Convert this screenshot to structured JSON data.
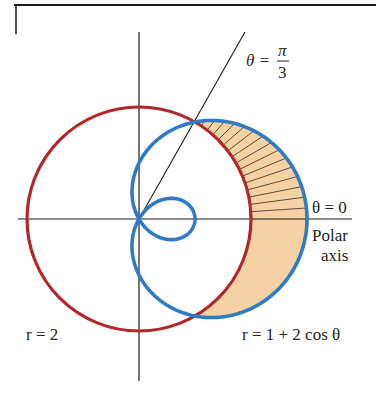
{
  "figure": {
    "type": "polar-area-diagram",
    "colors": {
      "circle": "#b0282a",
      "cardioid": "#2f7bc8",
      "shade": "#f4d2a4",
      "hatch": "#3a2a1a",
      "axis": "#1a1a1a",
      "frame": "#1a1a1a"
    },
    "geometry": {
      "origin_px": [
        139,
        219
      ],
      "scale_px_per_unit": 56
    },
    "curves": [
      {
        "name": "circle",
        "equation": "r = 2",
        "label": "r = 2"
      },
      {
        "name": "limacon",
        "equation": "r = 1 + 2 cos θ",
        "label": "r = 1 + 2 cos θ"
      }
    ],
    "rays": [
      {
        "angle": "π/3",
        "label_theta": "θ =",
        "label_num": "π",
        "label_den": "3"
      },
      {
        "angle": "0",
        "label": "θ = 0"
      }
    ],
    "axis_labels": {
      "polar_line1": "Polar",
      "polar_line2": "axis"
    },
    "shaded_region": {
      "description": "Region inside r = 1 + 2 cos θ and outside r = 2",
      "theta_range": "-π/3 to π/3",
      "hatched_part": "0 to π/3"
    }
  },
  "labels": {
    "theta_pi3_prefix": "θ =",
    "theta_pi3_num": "π",
    "theta_pi3_den": "3",
    "theta_zero": "θ = 0",
    "polar": "Polar",
    "axis": "axis",
    "circle_eq": "r = 2",
    "limacon_eq": "r = 1 + 2 cos θ"
  }
}
